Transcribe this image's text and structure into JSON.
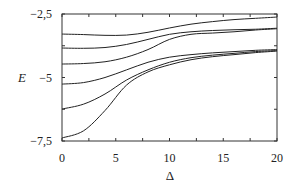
{
  "chart_data": {
    "type": "line",
    "title": "",
    "xlabel": "Δ",
    "ylabel": "E",
    "xlim": [
      0,
      20
    ],
    "ylim": [
      -7.5,
      -2.5
    ],
    "grid": false,
    "legend": null,
    "x_ticks": [
      0,
      5,
      10,
      15,
      20
    ],
    "x_tick_labels": [
      "0",
      "5",
      "10",
      "15",
      "20"
    ],
    "y_ticks": [
      -2.5,
      -5,
      -7.5
    ],
    "y_tick_labels": [
      "−2,5",
      "−5",
      "−7,5"
    ],
    "x": [
      0,
      2,
      4,
      6,
      8,
      10,
      12,
      14,
      16,
      18,
      20
    ],
    "series": [
      {
        "name": "level 1",
        "values": [
          -3.29,
          -3.31,
          -3.34,
          -3.33,
          -3.22,
          -3.05,
          -2.9,
          -2.8,
          -2.72,
          -2.67,
          -2.62
        ]
      },
      {
        "name": "level 2",
        "values": [
          -3.84,
          -3.85,
          -3.82,
          -3.7,
          -3.5,
          -3.3,
          -3.2,
          -3.15,
          -3.12,
          -3.1,
          -3.06
        ]
      },
      {
        "name": "level 3",
        "values": [
          -4.47,
          -4.45,
          -4.38,
          -4.2,
          -3.9,
          -3.5,
          -3.3,
          -3.25,
          -3.2,
          -3.13,
          -3.08
        ]
      },
      {
        "name": "level 4",
        "values": [
          -5.26,
          -5.2,
          -5.0,
          -4.7,
          -4.4,
          -4.2,
          -4.1,
          -4.03,
          -3.98,
          -3.93,
          -3.9
        ]
      },
      {
        "name": "level 5",
        "values": [
          -6.24,
          -6.05,
          -5.65,
          -5.1,
          -4.7,
          -4.4,
          -4.22,
          -4.12,
          -4.05,
          -3.98,
          -3.94
        ]
      },
      {
        "name": "level 6",
        "values": [
          -7.38,
          -7.1,
          -6.3,
          -5.3,
          -4.78,
          -4.5,
          -4.3,
          -4.18,
          -4.1,
          -4.02,
          -3.96
        ]
      }
    ]
  }
}
